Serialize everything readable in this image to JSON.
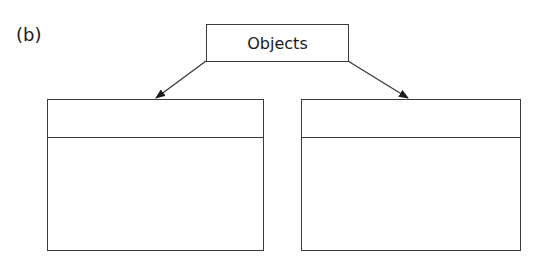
{
  "figure_label": "(b)",
  "root": {
    "label": "Objects"
  },
  "children": [
    {
      "name": "left-box",
      "sections": 2
    },
    {
      "name": "right-box",
      "sections": 2
    }
  ],
  "colors": {
    "stroke": "#3a3a3a",
    "background": "#ffffff"
  }
}
